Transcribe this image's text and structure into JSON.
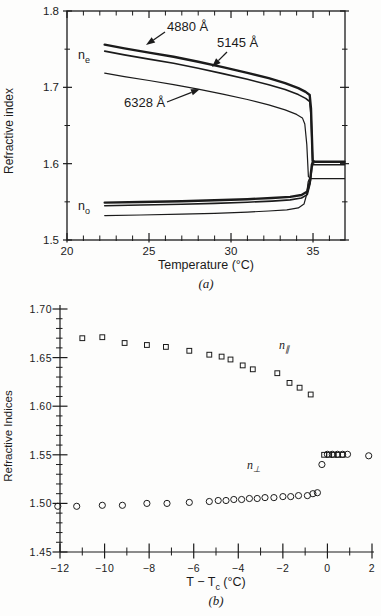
{
  "colors": {
    "ink": "#1b1b1b",
    "background": "#fdfdfc"
  },
  "chart_data": [
    {
      "id": "a",
      "type": "line",
      "title": "",
      "xlabel": "Temperature (°C)",
      "ylabel": "Refractive index",
      "caption": "(a)",
      "xlim": [
        20,
        36.95
      ],
      "ylim": [
        1.5,
        1.8
      ],
      "grid": false,
      "frame": "box",
      "x_major_ticks": [
        20,
        25,
        30,
        35
      ],
      "x_tick_labels": [
        "20",
        "25",
        "30",
        "35"
      ],
      "x_minor_ticks": [
        21,
        22,
        23,
        24,
        26,
        27,
        28,
        29,
        31,
        32,
        33,
        34,
        36
      ],
      "y_major_ticks": [
        1.5,
        1.6,
        1.7,
        1.8
      ],
      "y_tick_labels": [
        "1.5",
        "1.6",
        "1.7",
        "1.8"
      ],
      "y_minor_ticks": [
        1.55,
        1.65,
        1.75
      ],
      "px_box": {
        "l": 67,
        "r": 345,
        "t": 11,
        "b": 240
      },
      "series": [
        {
          "name": "n_e 4880 Å",
          "slug": "ne-4880",
          "width": 2.4,
          "points": [
            [
              22.3,
              1.756
            ],
            [
              23.5,
              1.751
            ],
            [
              25,
              1.7455
            ],
            [
              26.5,
              1.74
            ],
            [
              28,
              1.7335
            ],
            [
              29.5,
              1.7265
            ],
            [
              31,
              1.719
            ],
            [
              32.3,
              1.712
            ],
            [
              33.3,
              1.7055
            ],
            [
              34.1,
              1.699
            ],
            [
              34.55,
              1.694
            ],
            [
              34.8,
              1.69
            ],
            [
              34.88,
              1.672
            ],
            [
              34.98,
              1.604
            ],
            [
              35.1,
              1.6025
            ],
            [
              36.92,
              1.6025
            ]
          ]
        },
        {
          "name": "n_e 5145 Å",
          "slug": "ne-5145",
          "width": 1.6,
          "points": [
            [
              22.3,
              1.7475
            ],
            [
              23.5,
              1.7425
            ],
            [
              25,
              1.737
            ],
            [
              26.5,
              1.7315
            ],
            [
              28,
              1.725
            ],
            [
              29.5,
              1.718
            ],
            [
              31,
              1.7105
            ],
            [
              32.3,
              1.7035
            ],
            [
              33.3,
              1.697
            ],
            [
              34.1,
              1.6905
            ],
            [
              34.55,
              1.6855
            ],
            [
              34.8,
              1.6815
            ],
            [
              34.88,
              1.664
            ],
            [
              34.98,
              1.6
            ],
            [
              35.1,
              1.5985
            ],
            [
              36.92,
              1.5985
            ]
          ]
        },
        {
          "name": "n_e 6328 Å",
          "slug": "ne-6328",
          "width": 1.2,
          "points": [
            [
              22.3,
              1.7185
            ],
            [
              23.5,
              1.714
            ],
            [
              25,
              1.709
            ],
            [
              26.5,
              1.7035
            ],
            [
              28,
              1.6975
            ],
            [
              29.5,
              1.691
            ],
            [
              31,
              1.684
            ],
            [
              32.3,
              1.677
            ],
            [
              33.3,
              1.6705
            ],
            [
              34.0,
              1.6645
            ],
            [
              34.35,
              1.66
            ],
            [
              34.5,
              1.652
            ],
            [
              34.62,
              1.625
            ],
            [
              34.72,
              1.583
            ],
            [
              34.85,
              1.5805
            ],
            [
              36.92,
              1.5805
            ]
          ]
        },
        {
          "name": "n_o 4880 Å",
          "slug": "no-4880",
          "width": 2.4,
          "points": [
            [
              22.3,
              1.549
            ],
            [
              24.5,
              1.5498
            ],
            [
              27,
              1.5508
            ],
            [
              29,
              1.552
            ],
            [
              31,
              1.5535
            ],
            [
              32.5,
              1.555
            ],
            [
              33.6,
              1.5565
            ],
            [
              34.3,
              1.559
            ],
            [
              34.65,
              1.5635
            ],
            [
              34.82,
              1.578
            ],
            [
              34.93,
              1.599
            ],
            [
              35.0,
              1.6025
            ]
          ]
        },
        {
          "name": "n_o 5145 Å",
          "slug": "no-5145",
          "width": 1.6,
          "points": [
            [
              22.3,
              1.545
            ],
            [
              24.5,
              1.5458
            ],
            [
              27,
              1.5468
            ],
            [
              29,
              1.548
            ],
            [
              31,
              1.5495
            ],
            [
              32.5,
              1.551
            ],
            [
              33.6,
              1.5525
            ],
            [
              34.3,
              1.555
            ],
            [
              34.65,
              1.5595
            ],
            [
              34.82,
              1.574
            ],
            [
              34.93,
              1.595
            ],
            [
              35.0,
              1.5985
            ]
          ]
        },
        {
          "name": "n_o 6328 Å",
          "slug": "no-6328",
          "width": 1.2,
          "points": [
            [
              22.3,
              1.532
            ],
            [
              24.5,
              1.5328
            ],
            [
              27,
              1.5338
            ],
            [
              29,
              1.535
            ],
            [
              31,
              1.5365
            ],
            [
              32.3,
              1.538
            ],
            [
              33.4,
              1.5395
            ],
            [
              34.1,
              1.542
            ],
            [
              34.45,
              1.547
            ],
            [
              34.6,
              1.559
            ],
            [
              34.7,
              1.576
            ],
            [
              34.78,
              1.5805
            ]
          ]
        }
      ],
      "curve_labels": [
        {
          "base": "n",
          "sub": "e",
          "slug": "n-e",
          "px": [
            78,
            49
          ]
        },
        {
          "base": "n",
          "sub": "o",
          "slug": "n-o",
          "px": [
            78,
            200
          ]
        }
      ],
      "annotations": [
        {
          "text": "4880 Å",
          "slug": "label-4880",
          "px": [
            167,
            20
          ],
          "arrow": [
            165,
            32,
            146,
            45
          ]
        },
        {
          "text": "5145 Å",
          "slug": "label-5145",
          "px": [
            217,
            36
          ],
          "arrow": [
            227,
            52,
            212,
            67
          ]
        },
        {
          "text": "6328 Å",
          "slug": "label-6328",
          "px": [
            124,
            96
          ],
          "arrow": [
            167,
            102,
            200,
            89
          ]
        }
      ]
    },
    {
      "id": "b",
      "type": "scatter",
      "title": "",
      "xlabel_parts": {
        "prefix": "T − T",
        "sub": "c",
        "suffix": " (°C)"
      },
      "ylabel": "Refractive Indices",
      "caption": "(b)",
      "xlim": [
        -12,
        2
      ],
      "ylim": [
        1.45,
        1.7
      ],
      "grid": false,
      "frame": "axes",
      "x_major_ticks": [
        -12,
        -10,
        -8,
        -6,
        -4,
        -2,
        0,
        2
      ],
      "x_tick_labels": [
        "−12",
        "−10",
        "−8",
        "−6",
        "−4",
        "−2",
        "0",
        "2"
      ],
      "x_minor_ticks": [
        -11,
        -9,
        -7,
        -5,
        -3,
        -1,
        1
      ],
      "y_major_ticks": [
        1.45,
        1.5,
        1.55,
        1.6,
        1.65,
        1.7
      ],
      "y_tick_labels": [
        "1.45",
        "1.50",
        "1.55",
        "1.60",
        "1.65",
        "1.70"
      ],
      "y_minor_step": 0.01,
      "px_box": {
        "l": 60,
        "r": 372,
        "t": 309,
        "b": 552
      },
      "series": [
        {
          "name": "n parallel",
          "slug": "n-parallel",
          "marker": "square",
          "size": 4.8,
          "points": [
            [
              -11.0,
              1.67
            ],
            [
              -10.1,
              1.671
            ],
            [
              -9.1,
              1.665
            ],
            [
              -8.1,
              1.663
            ],
            [
              -7.25,
              1.661
            ],
            [
              -6.2,
              1.657
            ],
            [
              -5.3,
              1.653
            ],
            [
              -4.75,
              1.651
            ],
            [
              -4.35,
              1.648
            ],
            [
              -3.8,
              1.642
            ],
            [
              -3.35,
              1.638
            ],
            [
              -2.25,
              1.634
            ],
            [
              -1.7,
              1.624
            ],
            [
              -1.25,
              1.619
            ],
            [
              -0.75,
              1.612
            ],
            [
              -0.15,
              1.55
            ],
            [
              0.08,
              1.55
            ],
            [
              0.28,
              1.55
            ],
            [
              0.48,
              1.55
            ],
            [
              0.68,
              1.55
            ]
          ]
        },
        {
          "name": "n perpendicular",
          "slug": "n-perpendicular",
          "marker": "circle",
          "size": 6.2,
          "points": [
            [
              -12.1,
              1.497
            ],
            [
              -11.25,
              1.497
            ],
            [
              -10.1,
              1.498
            ],
            [
              -9.2,
              1.498
            ],
            [
              -8.1,
              1.5
            ],
            [
              -7.2,
              1.5
            ],
            [
              -6.2,
              1.501
            ],
            [
              -5.3,
              1.502
            ],
            [
              -4.9,
              1.503
            ],
            [
              -4.55,
              1.503
            ],
            [
              -4.2,
              1.504
            ],
            [
              -3.85,
              1.504
            ],
            [
              -3.5,
              1.505
            ],
            [
              -3.15,
              1.505
            ],
            [
              -2.8,
              1.506
            ],
            [
              -2.4,
              1.506
            ],
            [
              -2.0,
              1.507
            ],
            [
              -1.65,
              1.507
            ],
            [
              -1.3,
              1.508
            ],
            [
              -0.9,
              1.508
            ],
            [
              -0.65,
              1.51
            ],
            [
              -0.45,
              1.511
            ],
            [
              -0.25,
              1.54
            ],
            [
              0.0,
              1.5505
            ],
            [
              0.22,
              1.5505
            ],
            [
              0.45,
              1.5505
            ],
            [
              0.68,
              1.5505
            ],
            [
              0.9,
              1.5505
            ],
            [
              1.85,
              1.549
            ]
          ]
        }
      ],
      "curve_labels": [
        {
          "base": "n",
          "sub": "∥",
          "slug": "n-parallel",
          "px": [
            279,
            339
          ]
        },
        {
          "base": "n",
          "sub": "⊥",
          "slug": "n-perp",
          "px": [
            247,
            459
          ]
        }
      ],
      "annotations": []
    }
  ]
}
